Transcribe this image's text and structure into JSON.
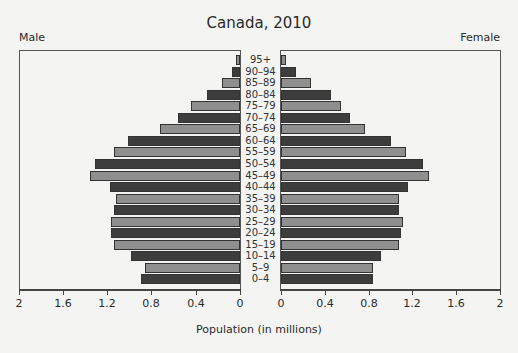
{
  "chart_data": {
    "type": "bar",
    "subtype": "population-pyramid",
    "title": "Canada, 2010",
    "xlabel": "Population (in millions)",
    "ylabel": "",
    "left_label": "Male",
    "right_label": "Female",
    "xlim": [
      0,
      2
    ],
    "xticks": [
      "2",
      "1.6",
      "1.2",
      "0.8",
      "0.4",
      "0",
      "0",
      "0.4",
      "0.8",
      "1.2",
      "1.6",
      "2"
    ],
    "grid": false,
    "legend": null,
    "categories": [
      "95+",
      "90–94",
      "85–89",
      "80–84",
      "75–79",
      "70–74",
      "65–69",
      "60–64",
      "55–59",
      "50–54",
      "45–49",
      "40–44",
      "35–39",
      "30–34",
      "25–29",
      "20–24",
      "15–19",
      "10–14",
      "5–9",
      "0–4"
    ],
    "series": [
      {
        "name": "Male",
        "values": [
          0.04,
          0.07,
          0.16,
          0.3,
          0.44,
          0.56,
          0.72,
          1.01,
          1.14,
          1.31,
          1.36,
          1.18,
          1.12,
          1.14,
          1.17,
          1.17,
          1.14,
          0.99,
          0.86,
          0.9
        ]
      },
      {
        "name": "Female",
        "values": [
          0.05,
          0.14,
          0.27,
          0.46,
          0.55,
          0.63,
          0.77,
          1.0,
          1.14,
          1.3,
          1.35,
          1.16,
          1.08,
          1.08,
          1.11,
          1.1,
          1.08,
          0.91,
          0.84,
          0.84
        ]
      }
    ],
    "colors": {
      "dark": "#3d3d3d",
      "light": "#8f8f8f"
    }
  }
}
